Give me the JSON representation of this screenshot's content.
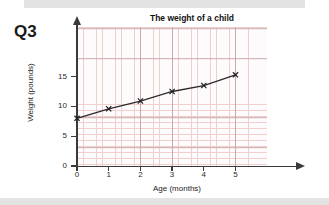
{
  "question_label": "Q3",
  "chart_data": {
    "type": "line",
    "title": "The weight of a child",
    "xlabel": "Age (months)",
    "ylabel": "Weight (pounds)",
    "x": [
      0,
      1,
      2,
      3,
      4,
      5
    ],
    "values": [
      8.0,
      9.6,
      10.9,
      12.5,
      13.5,
      15.3
    ],
    "xlim": [
      0,
      5.6
    ],
    "ylim": [
      0,
      17
    ],
    "xticks": [
      "0",
      "1",
      "2",
      "3",
      "4",
      "5"
    ],
    "yticks": [
      "0",
      "5",
      "10",
      "15"
    ],
    "grid": true,
    "grid_style": "graph-paper",
    "legend": "none",
    "marker": "x",
    "line_color": "#2b2b2b",
    "grid_minor_color": "#f0cfcf",
    "grid_major_color": "#c9a9a9",
    "axis_color": "#3a3a3a"
  }
}
